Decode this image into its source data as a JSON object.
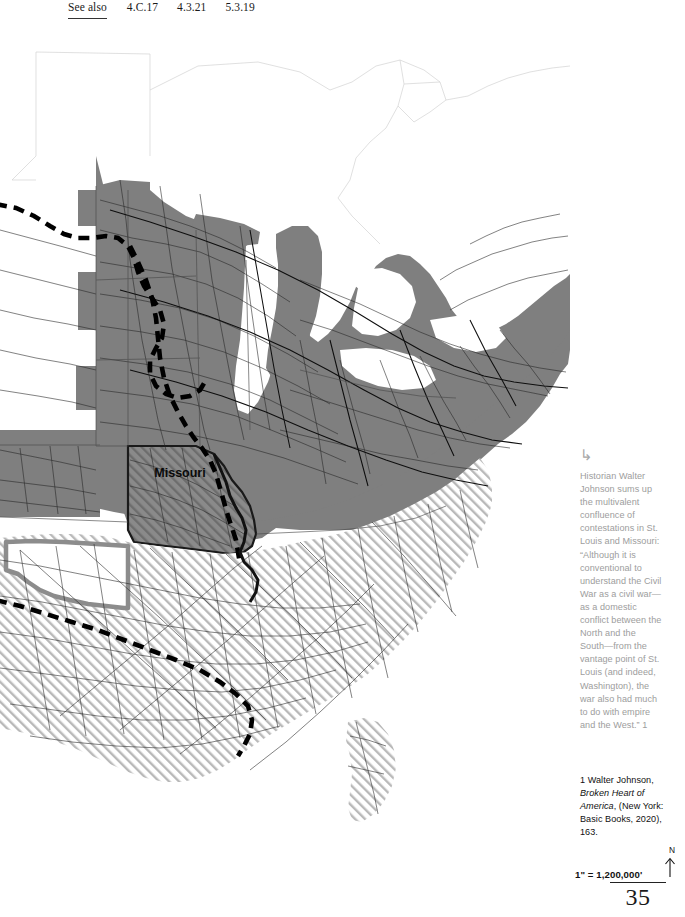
{
  "header": {
    "see_also_label": "See also",
    "references": [
      "4.C.17",
      "4.3.21",
      "5.3.19"
    ]
  },
  "map": {
    "title": "Civil War era United States railroad network",
    "labels": [
      {
        "text": "Missouri",
        "x": 180,
        "y": 447
      }
    ],
    "legend_colors": {
      "union_fill": "#7f7f7f",
      "confederate_hatch": "#555555",
      "water": "#ffffff",
      "border_state_fill": "#7f7f7f",
      "route_line": "#000000",
      "territory_border": "#8c8c8c",
      "state_outline": "#cfcfcf",
      "railroad": "#2b2b2b"
    },
    "regions": {
      "union_label": "Union states (solid gray fill)",
      "confederate_label": "Confederate states (diagonal hatch)",
      "border_label": "Border state: Missouri (gray fill with hatch)",
      "territory_label": "Indian Territory (outlined, unfilled)"
    }
  },
  "annotation": {
    "arrow_glyph": "↳",
    "body": "Historian Walter Johnson sums up the multivalent confluence of contestations in St. Louis and Missouri: “Although it is conventional to understand the Civil War as a civil war—as a domestic conflict between the North and the South—from the vantage point of St. Louis (and indeed, Washington), the war also had much to do with empire and the West.” 1"
  },
  "footnote": {
    "number_author": "1 Walter Johnson,",
    "title": "Broken Heart of America",
    "publication": ", (New York: Basic Books, 2020), 163."
  },
  "scale": {
    "text": "1\" = 1,200,000'",
    "north_letter": "N",
    "north_arrow": "north-arrow-icon"
  },
  "page": {
    "number": "35"
  }
}
